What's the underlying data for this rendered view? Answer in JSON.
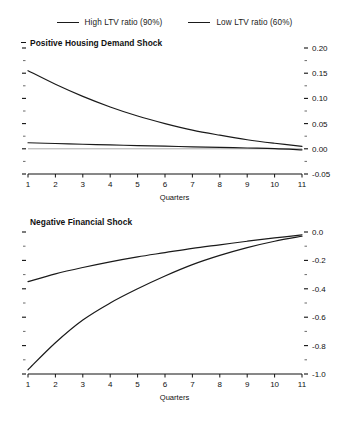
{
  "legend": {
    "items": [
      {
        "label": "High LTV ratio (90%)",
        "color": "#1a1a1a",
        "key": "high"
      },
      {
        "label": "Low LTV ratio (60%)",
        "color": "#1a1a1a",
        "key": "low"
      }
    ]
  },
  "chart_data": [
    {
      "type": "line",
      "title": "Positive Housing Demand Shock",
      "xlabel": "Quarters",
      "ylabel": "",
      "x": [
        1,
        2,
        3,
        4,
        5,
        6,
        7,
        8,
        9,
        10,
        11
      ],
      "xlim": [
        1,
        11
      ],
      "xticks": [
        1,
        2,
        3,
        4,
        5,
        6,
        7,
        8,
        9,
        10,
        11
      ],
      "xticklabels": [
        "1",
        "2",
        "3",
        "4",
        "5",
        "6",
        "7",
        "8",
        "9",
        "10",
        "11"
      ],
      "ylim": [
        -0.05,
        0.2
      ],
      "yticks": [
        -0.05,
        0.0,
        0.05,
        0.1,
        0.15,
        0.2
      ],
      "yticklabels": [
        "-0.05",
        "0.00",
        "0.05",
        "0.10",
        "0.15",
        "0.20"
      ],
      "yminorticks": [
        -0.025,
        0.025,
        0.075,
        0.125,
        0.175
      ],
      "y_axis_side": "right",
      "grid": false,
      "legend_position": "top-center-outside",
      "zero_line": true,
      "series": [
        {
          "name": "High LTV ratio (90%)",
          "color": "#1a1a1a",
          "values": [
            0.155,
            0.128,
            0.104,
            0.083,
            0.065,
            0.05,
            0.037,
            0.027,
            0.018,
            0.011,
            0.005
          ]
        },
        {
          "name": "Low LTV ratio (60%)",
          "color": "#1a1a1a",
          "values": [
            0.012,
            0.0105,
            0.009,
            0.0077,
            0.0064,
            0.0052,
            0.004,
            0.0028,
            0.0016,
            0.0004,
            -0.002
          ]
        }
      ]
    },
    {
      "type": "line",
      "title": "Negative Financial Shock",
      "xlabel": "Quarters",
      "ylabel": "",
      "x": [
        1,
        2,
        3,
        4,
        5,
        6,
        7,
        8,
        9,
        10,
        11
      ],
      "xlim": [
        1,
        11
      ],
      "xticks": [
        1,
        2,
        3,
        4,
        5,
        6,
        7,
        8,
        9,
        10,
        11
      ],
      "xticklabels": [
        "1",
        "2",
        "3",
        "4",
        "5",
        "6",
        "7",
        "8",
        "9",
        "10",
        "11"
      ],
      "ylim": [
        -1.0,
        0.0
      ],
      "yticks": [
        -1.0,
        -0.8,
        -0.6,
        -0.4,
        -0.2,
        0.0
      ],
      "yticklabels": [
        "-1.0",
        "-0.8",
        "-0.6",
        "-0.4",
        "-0.2",
        "0.0"
      ],
      "yminorticks": [
        -0.9,
        -0.7,
        -0.5,
        -0.3,
        -0.1
      ],
      "y_axis_side": "right",
      "grid": false,
      "legend_position": "top-center-outside",
      "zero_line": false,
      "series": [
        {
          "name": "High LTV ratio (90%)",
          "color": "#1a1a1a",
          "values": [
            -0.97,
            -0.78,
            -0.62,
            -0.5,
            -0.4,
            -0.31,
            -0.23,
            -0.165,
            -0.11,
            -0.065,
            -0.03
          ]
        },
        {
          "name": "Low LTV ratio (60%)",
          "color": "#1a1a1a",
          "values": [
            -0.35,
            -0.295,
            -0.25,
            -0.21,
            -0.175,
            -0.145,
            -0.115,
            -0.09,
            -0.065,
            -0.042,
            -0.02
          ]
        }
      ]
    }
  ]
}
